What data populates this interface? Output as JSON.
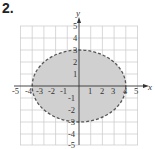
{
  "problem": {
    "label": "2."
  },
  "graph": {
    "x_axis_label": "x",
    "y_axis_label": "y",
    "x_ticks": [
      "-5",
      "-4",
      "-3",
      "-2",
      "-1",
      "1",
      "2",
      "3",
      "4",
      "5"
    ],
    "y_ticks": [
      "5",
      "4",
      "3",
      "2",
      "1",
      "-1",
      "-2",
      "-3",
      "-4",
      "-5"
    ],
    "grid_range": {
      "x": [
        -5,
        5
      ],
      "y": [
        -5,
        5
      ]
    },
    "ellipse": {
      "center": [
        0,
        0
      ],
      "semi_major_x": 4,
      "semi_minor_y": 3,
      "boundary": "dashed",
      "interior": "shaded"
    },
    "colors": {
      "shade": "#d0d0d0",
      "boundary": "#555555",
      "grid": "#c8c8c8",
      "axis": "#333333"
    }
  }
}
